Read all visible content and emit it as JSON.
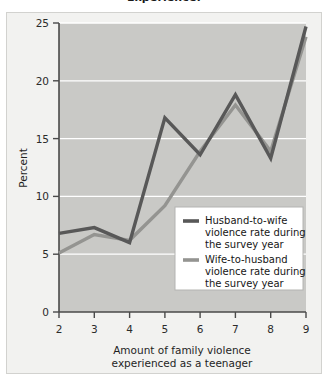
{
  "figure": {
    "partial_title": "Experience:"
  },
  "chart_data": {
    "type": "line",
    "title": "",
    "xlabel": "Amount of family violence experienced as a teenager",
    "ylabel": "Percent",
    "x": [
      2,
      3,
      4,
      5,
      6,
      7,
      8,
      9
    ],
    "xlim": [
      2,
      9
    ],
    "ylim": [
      0,
      25
    ],
    "xticks": [
      "2",
      "3",
      "4",
      "5",
      "6",
      "7",
      "8",
      "9"
    ],
    "yticks": [
      "0",
      "5",
      "10",
      "15",
      "20",
      "25"
    ],
    "grid": "horizontal",
    "legend_position": "inside-lower-right",
    "plot_background": "#c9c9c6",
    "series": [
      {
        "name": "Husband-to-wife violence rate during the survey year",
        "color": "#585858",
        "values": [
          6.8,
          7.3,
          6.0,
          16.8,
          13.6,
          18.8,
          13.3,
          24.7
        ]
      },
      {
        "name": "Wife-to-husband violence rate during the survey year",
        "color": "#949491",
        "values": [
          5.1,
          6.7,
          6.2,
          9.2,
          13.9,
          17.9,
          13.9,
          23.8
        ]
      }
    ]
  },
  "legend": {
    "entries": [
      {
        "label_line1": "Husband-to-wife",
        "label_line2": "violence rate during",
        "label_line3": "the survey year",
        "swatch_color": "#585858"
      },
      {
        "label_line1": "Wife-to-husband",
        "label_line2": "violence rate during",
        "label_line3": "the survey year",
        "swatch_color": "#949491"
      }
    ]
  },
  "axes": {
    "x_title_line1": "Amount of family violence",
    "x_title_line2": "experienced as a teenager",
    "y_title": "Percent"
  }
}
